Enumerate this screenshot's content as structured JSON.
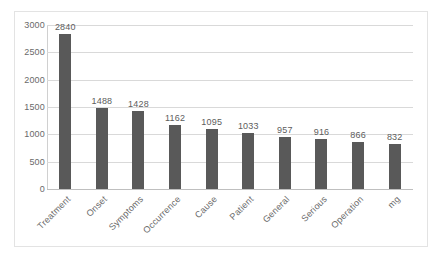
{
  "chart_data": {
    "type": "bar",
    "title": "",
    "subtitle": "",
    "xlabel": "",
    "ylabel": "",
    "categories": [
      "Treatment",
      "Onset",
      "Symptoms",
      "Occurrence",
      "Cause",
      "Patient",
      "General",
      "Serious",
      "Operation",
      "mg"
    ],
    "values": [
      2840,
      1488,
      1428,
      1162,
      1095,
      1033,
      957,
      916,
      866,
      832
    ],
    "data_labels": [
      "2840",
      "1488",
      "1428",
      "1162",
      "1095",
      "1033",
      "957",
      "916",
      "866",
      "832"
    ],
    "ylim": [
      0,
      3000
    ],
    "y_ticks": [
      0,
      500,
      1000,
      1500,
      2000,
      2500,
      3000
    ],
    "y_tick_labels": [
      "0",
      "500",
      "1000",
      "1500",
      "2000",
      "2500",
      "3000"
    ],
    "grid": true,
    "grid_axis": "y",
    "legend": false,
    "legend_position": "none",
    "bar_color": "#595959",
    "gridline_color": "#d9d9d9",
    "axis_color": "#bfbfbf",
    "text_color": "#6a6a6a",
    "border_color": "#e3e3e3",
    "background_color": "#ffffff",
    "x_label_rotation": -45
  }
}
